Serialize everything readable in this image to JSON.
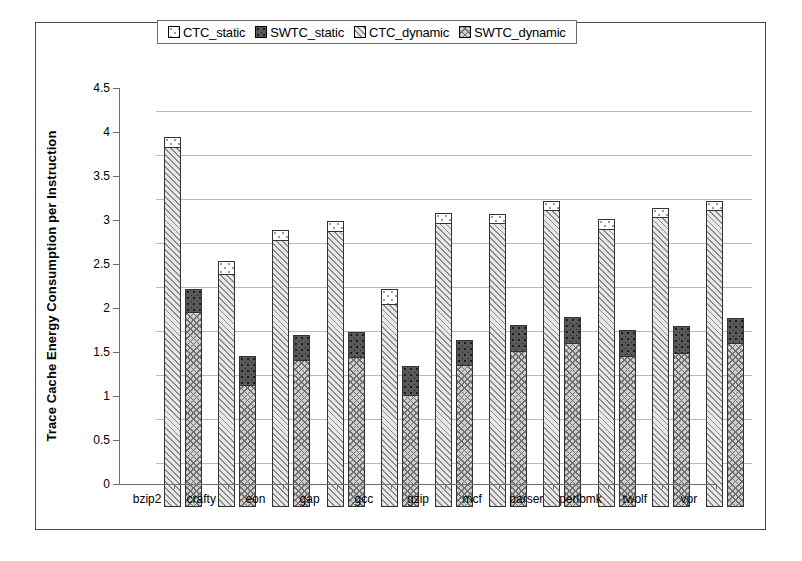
{
  "chart_data": {
    "type": "bar",
    "title": "",
    "subtitle": "",
    "xlabel": "",
    "ylabel": "Trace Cache Energy Consumption per Instruction",
    "ylim": [
      0,
      4.5
    ],
    "ytick_labels": [
      "4.5",
      "4",
      "3.5",
      "3",
      "2.5",
      "2",
      "1.5",
      "1",
      "0.5",
      "0"
    ],
    "ytick_values": [
      4.5,
      4,
      3.5,
      3,
      2.5,
      2,
      1.5,
      1,
      0.5,
      0
    ],
    "grid": "horizontal",
    "legend_position": "top-center",
    "stacked": true,
    "categories": [
      "bzip2",
      "crafty",
      "eon",
      "gap",
      "gcc",
      "gzip",
      "mcf",
      "parser",
      "perlbmk",
      "twolf",
      "vpr"
    ],
    "bar_groups": [
      "CTC",
      "SWTC"
    ],
    "series": [
      {
        "name": "CTC_static",
        "group": "CTC",
        "values": [
          0.1,
          0.14,
          0.11,
          0.1,
          0.16,
          0.1,
          0.09,
          0.09,
          0.1,
          0.09,
          0.09
        ]
      },
      {
        "name": "SWTC_static",
        "group": "SWTC",
        "values": [
          0.25,
          0.32,
          0.27,
          0.27,
          0.32,
          0.28,
          0.29,
          0.28,
          0.28,
          0.3,
          0.28
        ]
      },
      {
        "name": "CTC_dynamic",
        "group": "CTC",
        "values": [
          4.1,
          2.66,
          3.04,
          3.15,
          2.32,
          3.24,
          3.24,
          3.39,
          3.17,
          3.31,
          3.39
        ]
      },
      {
        "name": "SWTC_dynamic",
        "group": "SWTC",
        "values": [
          2.23,
          1.4,
          1.68,
          1.72,
          1.28,
          1.62,
          1.78,
          1.88,
          1.73,
          1.76,
          1.87
        ]
      }
    ],
    "totals": {
      "CTC": [
        4.2,
        2.8,
        3.15,
        3.25,
        2.48,
        3.34,
        3.33,
        3.48,
        3.27,
        3.4,
        3.48
      ],
      "SWTC": [
        2.48,
        1.72,
        1.95,
        1.99,
        1.6,
        1.9,
        2.07,
        2.16,
        2.01,
        2.06,
        2.15
      ]
    }
  },
  "legend": {
    "entries": [
      {
        "label": "CTC_static",
        "swatch": "dotted-light"
      },
      {
        "label": "SWTC_static",
        "swatch": "dotted-dark"
      },
      {
        "label": "CTC_dynamic",
        "swatch": "diagonal-light"
      },
      {
        "label": "SWTC_dynamic",
        "swatch": "crosshatch"
      }
    ]
  },
  "colors": {
    "frame": "#4a4a4a",
    "gridline": "#b9b9b9",
    "axis": "#6e6e6e",
    "ctc_static_fill": "#ffffff",
    "swtc_static_fill": "#595959",
    "ctc_dynamic_fill": "#e8e8e8",
    "swtc_dynamic_fill": "#cfcfcf",
    "bar_outline": "#333333"
  }
}
